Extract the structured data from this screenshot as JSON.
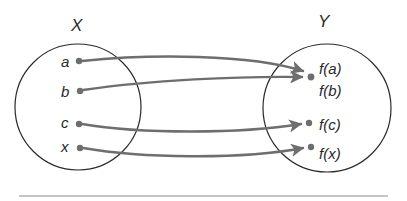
{
  "diagram": {
    "type": "function-mapping",
    "domain": {
      "label": "X",
      "elements": [
        "a",
        "b",
        "c",
        "x"
      ]
    },
    "codomain": {
      "label": "Y",
      "elements": [
        "f(a)",
        "f(b)",
        "f(c)",
        "f(x)"
      ]
    },
    "mappings": [
      {
        "from": "a",
        "to": "f(a)"
      },
      {
        "from": "b",
        "to": "f(b)"
      },
      {
        "from": "c",
        "to": "f(c)"
      },
      {
        "from": "x",
        "to": "f(x)"
      }
    ],
    "colors": {
      "circle": "#2a2a2a",
      "arrow": "#6e6e6e",
      "dot": "#6e6e6e",
      "rule": "#8a8a8a"
    }
  }
}
